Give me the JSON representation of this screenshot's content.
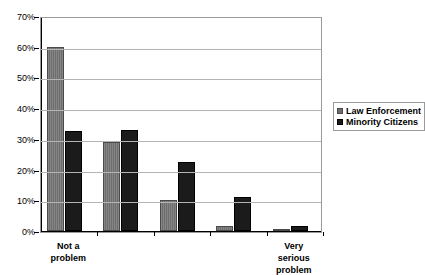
{
  "chart_data": {
    "type": "bar",
    "title": "",
    "xlabel": "",
    "ylabel": "",
    "ylim": [
      0,
      70
    ],
    "ytick_labels": [
      "0%",
      "10%",
      "20%",
      "30%",
      "40%",
      "50%",
      "60%",
      "70%"
    ],
    "ytick_values": [
      0,
      10,
      20,
      30,
      40,
      50,
      60,
      70
    ],
    "grid": true,
    "legend_position": "right",
    "categories": [
      "Not a\nproblem",
      "",
      "",
      "",
      "Very serious\nproblem"
    ],
    "category_labels_visible": [
      {
        "index": 0,
        "text": "Not a\nproblem"
      },
      {
        "index": 4,
        "text": "Very serious\nproblem"
      }
    ],
    "series": [
      {
        "name": "Law Enforcement",
        "color": "#6e6e6e",
        "values": [
          60,
          29,
          10,
          1.5,
          0.5
        ]
      },
      {
        "name": "Minority Citizens",
        "color": "#1b1b1b",
        "values": [
          32.5,
          33,
          22.5,
          11,
          1.5
        ]
      }
    ]
  },
  "legend": {
    "items": [
      {
        "label": "Law Enforcement"
      },
      {
        "label": "Minority Citizens"
      }
    ]
  }
}
